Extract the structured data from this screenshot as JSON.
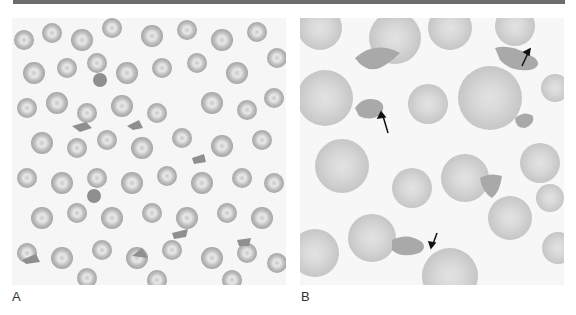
{
  "figure": {
    "panels": [
      {
        "id": "A",
        "label": "A",
        "description": "Peripheral blood smear, low magnification, numerous red blood cells with scattered fragmented cells (schistocytes)"
      },
      {
        "id": "B",
        "label": "B",
        "description": "Peripheral blood smear, high magnification, fragmented red cells indicated by arrows",
        "arrow_count": 3
      }
    ],
    "colors": {
      "header_bar": "#6d6d6d",
      "background": "#f6f6f6",
      "cell_A": "#b5b5b5",
      "cell_B": "#d2d2d2",
      "fragment": "#8f8f8f",
      "arrow": "#111111"
    }
  }
}
